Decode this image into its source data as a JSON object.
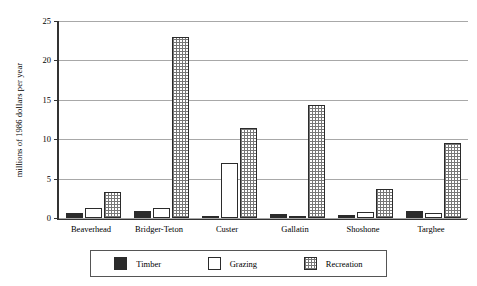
{
  "chart_data": {
    "type": "bar",
    "title": "",
    "subtitle": "",
    "xlabel": "",
    "ylabel": "millions of 1986 dollars per year",
    "ylim": [
      0,
      25
    ],
    "yticks": [
      0,
      5,
      10,
      15,
      20,
      25
    ],
    "grid": true,
    "legend_position": "bottom",
    "categories": [
      "Beaverhead",
      "Bridger-Teton",
      "Custer",
      "Gallatin",
      "Shoshone",
      "Targhee"
    ],
    "series": [
      {
        "name": "Timber",
        "color": "#2b2b2b",
        "pattern": "solid-black",
        "values": [
          0.6,
          0.9,
          0.3,
          0.5,
          0.35,
          0.9
        ]
      },
      {
        "name": "Grazing",
        "color": "#ffffff",
        "pattern": "solid-white",
        "values": [
          1.3,
          1.3,
          7.0,
          0.2,
          0.8,
          0.6
        ]
      },
      {
        "name": "Recreation",
        "color": "#777777",
        "pattern": "checkered",
        "values": [
          3.3,
          23.0,
          11.4,
          14.3,
          3.7,
          9.5
        ]
      }
    ]
  },
  "axis": {
    "y_title": "millions of 1986 dollars per year",
    "y_ticks": [
      "0",
      "5",
      "10",
      "15",
      "20",
      "25"
    ]
  },
  "legend": {
    "items": [
      {
        "label": "Timber"
      },
      {
        "label": "Grazing"
      },
      {
        "label": "Recreation"
      }
    ]
  },
  "x_categories": [
    "Beaverhead",
    "Bridger-Teton",
    "Custer",
    "Gallatin",
    "Shoshone",
    "Targhee"
  ]
}
